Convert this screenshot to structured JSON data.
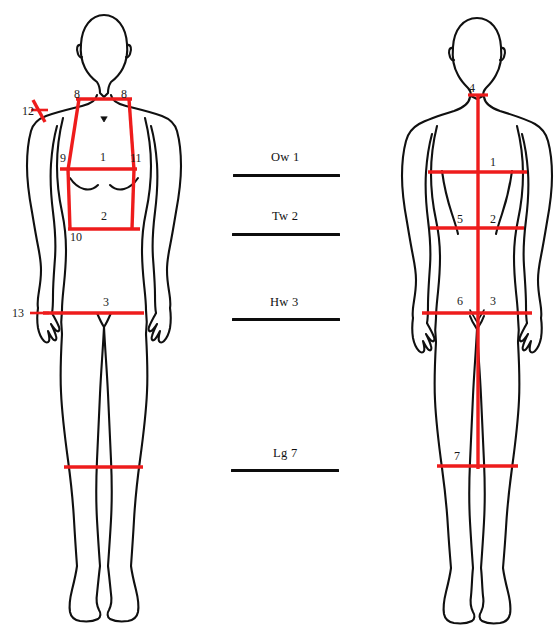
{
  "figure": {
    "view_front_name": "front-view-body-figure",
    "view_back_name": "back-view-body-figure",
    "line_color": "#ee1c1c",
    "outline_color": "#101010",
    "background_color": "#ffffff"
  },
  "front_view": {
    "labels": [
      {
        "id": "front-8-left",
        "text": "8",
        "x": 74,
        "y": 88
      },
      {
        "id": "front-8-right",
        "text": "8",
        "x": 121,
        "y": 88
      },
      {
        "id": "front-12",
        "text": "12",
        "x": 25,
        "y": 107
      },
      {
        "id": "front-9",
        "text": "9",
        "x": 62,
        "y": 154
      },
      {
        "id": "front-1",
        "text": "1",
        "x": 101,
        "y": 153
      },
      {
        "id": "front-11",
        "text": "11",
        "x": 131,
        "y": 154
      },
      {
        "id": "front-2",
        "text": "2",
        "x": 102,
        "y": 212
      },
      {
        "id": "front-10",
        "text": "10",
        "x": 73,
        "y": 231
      },
      {
        "id": "front-3",
        "text": "3",
        "x": 104,
        "y": 300
      },
      {
        "id": "front-13",
        "text": "13",
        "x": 15,
        "y": 309
      }
    ]
  },
  "back_view": {
    "labels": [
      {
        "id": "back-4",
        "text": "4",
        "x": 470,
        "y": 85
      },
      {
        "id": "back-1",
        "text": "1",
        "x": 491,
        "y": 159
      },
      {
        "id": "back-5",
        "text": "5",
        "x": 458,
        "y": 216
      },
      {
        "id": "back-2",
        "text": "2",
        "x": 491,
        "y": 216
      },
      {
        "id": "back-6",
        "text": "6",
        "x": 458,
        "y": 296
      },
      {
        "id": "back-3",
        "text": "3",
        "x": 491,
        "y": 296
      },
      {
        "id": "back-7",
        "text": "7",
        "x": 455,
        "y": 452
      }
    ]
  },
  "center_legend": {
    "items": [
      {
        "id": "legend-ow1",
        "label": "Ow 1",
        "label_x": 271,
        "label_y": 156,
        "rule_x": 233,
        "rule_y": 174,
        "rule_w": 107
      },
      {
        "id": "legend-tw2",
        "label": "Tw 2",
        "label_x": 272,
        "label_y": 215,
        "rule_x": 232,
        "rule_y": 233,
        "rule_w": 108
      },
      {
        "id": "legend-hw3",
        "label": "Hw 3",
        "label_x": 270,
        "label_y": 301,
        "rule_x": 232,
        "rule_y": 318,
        "rule_w": 108
      },
      {
        "id": "legend-lg7",
        "label": "Lg 7",
        "label_x": 273,
        "label_y": 452,
        "rule_x": 231,
        "rule_y": 469,
        "rule_w": 108
      }
    ]
  }
}
